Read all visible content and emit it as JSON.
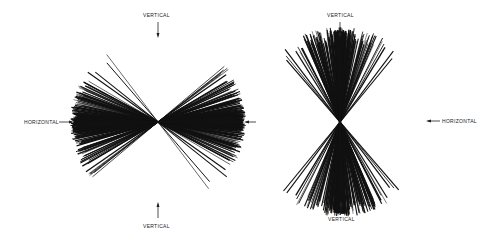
{
  "figure": {
    "left_panel": {
      "center": [
        158,
        122
      ],
      "labels": {
        "top": "VERTICAL",
        "bottom": "VERTICAL",
        "left": "HORIZONTAL"
      },
      "description": "Radial line burst concentrated near horizontal"
    },
    "right_panel": {
      "center": [
        340,
        122
      ],
      "labels": {
        "top": "VERTICAL",
        "bottom": "VERTICAL",
        "right": "HORIZONTAL"
      },
      "description": "Radial line burst concentrated near vertical"
    }
  }
}
